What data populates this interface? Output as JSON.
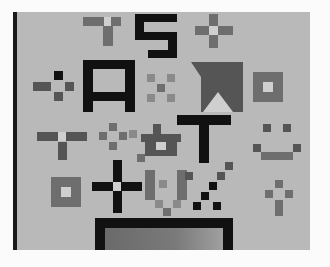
{
  "image": {
    "description": "Grayscale photograph of a printed pixel-art test card",
    "letters": [
      "S",
      "A",
      "T"
    ],
    "symbols": [
      "plus-cross",
      "diamond-cross",
      "hollow-square",
      "smiley-face",
      "x-cross",
      "triangle-panel",
      "bar-frame"
    ],
    "colors": {
      "background": "#b9b9b9",
      "ink_dark": "#111111",
      "ink_mid": "#6e6e6e",
      "border": "#fbfbfb"
    }
  }
}
